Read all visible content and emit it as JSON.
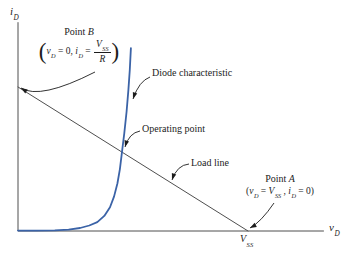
{
  "colors": {
    "background": "#ffffff",
    "curve": "#3b63a7",
    "line": "#4f4f4f",
    "text": "#1c1c1c"
  },
  "axes": {
    "y_label": {
      "base": "i",
      "sub": "D"
    },
    "x_label": {
      "base": "v",
      "sub": "D"
    },
    "x_tick": {
      "base": "V",
      "sub": "SS"
    }
  },
  "labels": {
    "diode": "Diode characteristic",
    "operating": "Operating point",
    "loadline": "Load line",
    "point_b_word": "Point",
    "point_b_letter": "B",
    "point_a_word": "Point",
    "point_a_letter": "A",
    "formula_b": {
      "open": "(",
      "v": "v",
      "v_sub": "D",
      "eq1": " = 0, ",
      "i": "i",
      "i_sub": "D",
      "eq2": " = ",
      "num": "V",
      "num_sub": "SS",
      "den": "R",
      "close": ")"
    },
    "formula_a": {
      "open": "(",
      "v": "v",
      "v_sub": "D",
      "eq1": " = ",
      "V": "V",
      "V_sub": "SS",
      "comma": " , ",
      "i": "i",
      "i_sub": "D",
      "eq2": " = 0",
      "close": ")"
    }
  },
  "chart_data": {
    "type": "line",
    "xlabel": "v_D",
    "ylabel": "i_D",
    "x_units": "multiples of V_SS",
    "y_units": "multiples of V_SS/R",
    "axis_range": {
      "x": [
        0,
        1.33
      ],
      "y": [
        0,
        1.45
      ]
    },
    "grid": false,
    "x_ticks": [
      {
        "v": 1,
        "label": "V_SS"
      }
    ],
    "series": [
      {
        "name": "Diode characteristic",
        "color": "#3b63a7",
        "x": [
          0,
          0.08,
          0.16,
          0.22,
          0.27,
          0.31,
          0.345,
          0.375,
          0.4,
          0.418,
          0.432,
          0.443,
          0.452,
          0.462,
          0.472,
          0.48,
          0.486,
          0.491
        ],
        "y": [
          0.003,
          0.003,
          0.005,
          0.01,
          0.021,
          0.038,
          0.062,
          0.105,
          0.165,
          0.24,
          0.33,
          0.43,
          0.55,
          0.68,
          0.83,
          0.98,
          1.12,
          1.27
        ]
      },
      {
        "name": "Load line",
        "color": "#4f4f4f",
        "x": [
          0,
          1
        ],
        "y": [
          1,
          0
        ]
      }
    ],
    "key_points": [
      {
        "name": "Point B",
        "v": 0,
        "i": 1,
        "desc": "v_D = 0, i_D = V_SS/R"
      },
      {
        "name": "Operating point",
        "v": 0.452,
        "i": 0.55
      },
      {
        "name": "Point A",
        "v": 1,
        "i": 0,
        "desc": "v_D = V_SS, i_D = 0"
      }
    ]
  },
  "figure": {
    "calib": {
      "x0": 18,
      "y0": 231,
      "x1": 248,
      "y1": 87
    },
    "arrows": [
      {
        "name": "point-b-arrow",
        "from": [
          95,
          72
        ],
        "ctrl": [
          40,
          100
        ],
        "to": [
          21,
          88
        ]
      },
      {
        "name": "diode-characteristic-arrow",
        "from": [
          150,
          77
        ],
        "ctrl": [
          139,
          81
        ],
        "to": [
          133,
          99
        ]
      },
      {
        "name": "operating-point-arrow",
        "from": [
          140,
          131
        ],
        "ctrl": [
          129,
          133
        ],
        "to": [
          125,
          147
        ]
      },
      {
        "name": "load-line-arrow",
        "from": [
          189,
          164
        ],
        "ctrl": [
          177,
          165
        ],
        "to": [
          172,
          180
        ]
      },
      {
        "name": "point-a-arrow",
        "from": [
          274,
          203
        ],
        "ctrl": [
          261,
          222
        ],
        "to": [
          250,
          228
        ]
      }
    ]
  }
}
